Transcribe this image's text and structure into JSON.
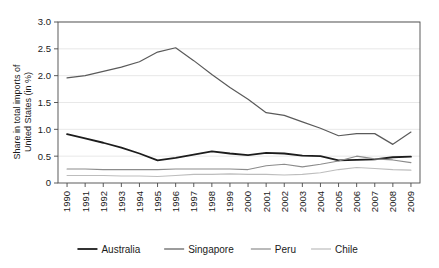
{
  "chart_data": {
    "type": "line",
    "title": "",
    "xlabel": "",
    "ylabel": "Share in total imports of United States (in %)",
    "ylabel_line1": "Share in total imports of",
    "ylabel_line2": "United States (in %)",
    "ylim": [
      0,
      3.0
    ],
    "yticks": [
      0,
      0.5,
      1.0,
      1.5,
      2.0,
      2.5,
      3.0
    ],
    "ytick_labels": [
      "0",
      "0.5",
      "1.0",
      "1.5",
      "2.0",
      "2.5",
      "3.0"
    ],
    "grid": true,
    "legend_position": "bottom",
    "x": [
      1990,
      1991,
      1992,
      1993,
      1994,
      1995,
      1996,
      1997,
      1998,
      1999,
      2000,
      2001,
      2002,
      2003,
      2004,
      2005,
      2006,
      2007,
      2008,
      2009
    ],
    "categories": [
      "1990",
      "1991",
      "1992",
      "1993",
      "1994",
      "1995",
      "1996",
      "1997",
      "1998",
      "1999",
      "2000",
      "2001",
      "2002",
      "2003",
      "2004",
      "2005",
      "2006",
      "2007",
      "2008",
      "2009"
    ],
    "series": [
      {
        "name": "Australia",
        "color": "#1c1c1c",
        "width": 1.8,
        "values": [
          0.91,
          0.83,
          0.75,
          0.66,
          0.55,
          0.42,
          0.47,
          0.53,
          0.59,
          0.55,
          0.52,
          0.56,
          0.55,
          0.51,
          0.5,
          0.42,
          0.43,
          0.44,
          0.48,
          0.49
        ]
      },
      {
        "name": "Singapore",
        "color": "#5a5a5a",
        "width": 1.2,
        "values": [
          1.96,
          2.0,
          2.08,
          2.16,
          2.26,
          2.44,
          2.52,
          2.28,
          2.02,
          1.78,
          1.56,
          1.31,
          1.26,
          1.14,
          1.02,
          0.88,
          0.92,
          0.92,
          0.72,
          0.95
        ]
      },
      {
        "name": "Peru",
        "color": "#8c8c8c",
        "width": 1.1,
        "values": [
          0.26,
          0.26,
          0.25,
          0.25,
          0.25,
          0.25,
          0.26,
          0.26,
          0.26,
          0.26,
          0.25,
          0.32,
          0.35,
          0.3,
          0.35,
          0.41,
          0.5,
          0.45,
          0.43,
          0.38
        ]
      },
      {
        "name": "Chile",
        "color": "#bdbdbd",
        "width": 1.1,
        "values": [
          0.14,
          0.14,
          0.14,
          0.13,
          0.13,
          0.12,
          0.14,
          0.16,
          0.16,
          0.17,
          0.16,
          0.16,
          0.15,
          0.16,
          0.19,
          0.25,
          0.29,
          0.27,
          0.25,
          0.24
        ]
      }
    ],
    "legend": [
      {
        "label": "Australia",
        "color": "#1c1c1c"
      },
      {
        "label": "Singapore",
        "color": "#5a5a5a"
      },
      {
        "label": "Peru",
        "color": "#8c8c8c"
      },
      {
        "label": "Chile",
        "color": "#bdbdbd"
      }
    ]
  }
}
